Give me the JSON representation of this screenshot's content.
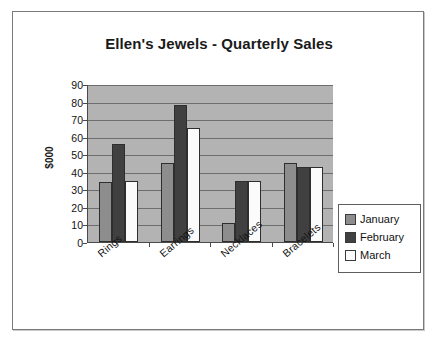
{
  "chart_data": {
    "type": "bar",
    "title": "Ellen's Jewels - Quarterly Sales",
    "xlabel": "",
    "ylabel": "$000",
    "ylim": [
      0,
      90
    ],
    "yticks": [
      90,
      80,
      70,
      60,
      50,
      40,
      30,
      20,
      10,
      0
    ],
    "grid": true,
    "legend_position": "right",
    "categories": [
      "Rings",
      "Earrings",
      "Necklaces",
      "Bracelets"
    ],
    "series": [
      {
        "name": "January",
        "color": "#8d8d8d",
        "values": [
          34,
          45,
          11,
          45
        ]
      },
      {
        "name": "February",
        "color": "#404040",
        "values": [
          56,
          78,
          35,
          43
        ]
      },
      {
        "name": "March",
        "color": "#fbfbfb",
        "values": [
          35,
          65,
          35,
          43
        ]
      }
    ]
  },
  "legend": {
    "items": [
      {
        "label": "January"
      },
      {
        "label": "February"
      },
      {
        "label": "March"
      }
    ]
  }
}
